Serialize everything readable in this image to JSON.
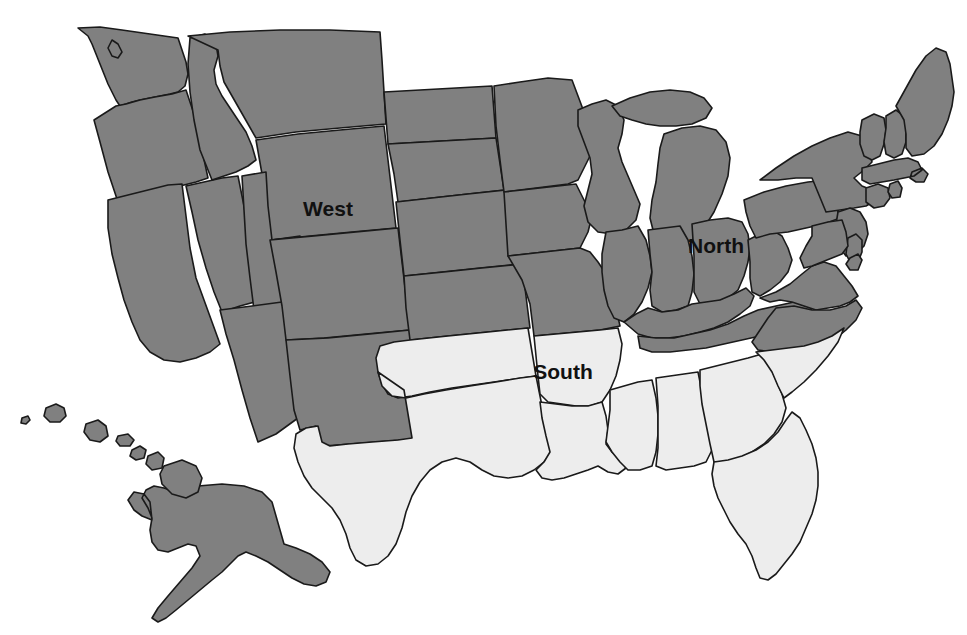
{
  "figure": {
    "type": "choropleth-map",
    "background_color": "#ffffff",
    "border_color": "#1a1a1a",
    "caption_remnant": ""
  },
  "legend_colors": {
    "dark_gray_fill": "#808080",
    "light_gray_fill": "#ededed",
    "water_fill": "#ffffff",
    "outline": "#1a1a1a"
  },
  "labels": [
    {
      "id": "west",
      "text": "West",
      "x": 328,
      "y": 216,
      "color": "#111111"
    },
    {
      "id": "north",
      "text": "North",
      "x": 716,
      "y": 253,
      "color": "#111111"
    },
    {
      "id": "south",
      "text": "South",
      "x": 563,
      "y": 379,
      "color": "#111111"
    }
  ],
  "chart_data": {
    "type": "map",
    "title": "",
    "regions": [
      {
        "name": "West",
        "fill": "#808080",
        "label_shown": "West",
        "members": [
          "Washington",
          "Oregon",
          "California",
          "Nevada",
          "Idaho",
          "Montana",
          "Wyoming",
          "Utah",
          "Arizona",
          "Colorado",
          "New Mexico",
          "North Dakota",
          "South Dakota",
          "Nebraska",
          "Kansas",
          "Minnesota",
          "Iowa",
          "Missouri",
          "Alaska",
          "Hawaii"
        ]
      },
      {
        "name": "North",
        "fill": "#808080",
        "label_shown": "North",
        "members": [
          "Wisconsin",
          "Michigan",
          "Illinois",
          "Indiana",
          "Ohio",
          "Kentucky",
          "Tennessee",
          "West Virginia",
          "Virginia",
          "North Carolina",
          "Pennsylvania",
          "New York",
          "New Jersey",
          "Delaware",
          "Maryland",
          "Connecticut",
          "Rhode Island",
          "Massachusetts",
          "Vermont",
          "New Hampshire",
          "Maine"
        ]
      },
      {
        "name": "South",
        "fill": "#ededed",
        "label_shown": "South",
        "members": [
          "Texas",
          "Oklahoma",
          "Arkansas",
          "Louisiana",
          "Mississippi",
          "Alabama",
          "Georgia",
          "Florida",
          "South Carolina"
        ]
      }
    ],
    "categories": [
      "West",
      "North",
      "South"
    ],
    "values": [
      20,
      21,
      9
    ],
    "value_meaning": "number of states shaded in each region",
    "xlabel": "Region",
    "ylabel": "States",
    "legend_position": "none",
    "grid": false
  }
}
